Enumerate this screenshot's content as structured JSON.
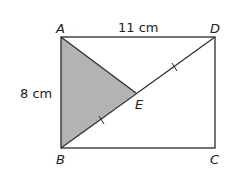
{
  "figure": {
    "vertices": {
      "A": "A",
      "B": "B",
      "C": "C",
      "D": "D",
      "E": "E"
    },
    "labels": {
      "top_side": "11 cm",
      "left_side": "8 cm"
    },
    "colors": {
      "shade": "#b3b3b3",
      "stroke": "#2a2a2a"
    }
  }
}
